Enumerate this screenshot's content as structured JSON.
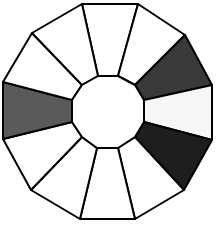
{
  "figure": {
    "outer_vertices": [
      [
        82,
        4
      ],
      [
        138,
        4
      ],
      [
        185,
        35
      ],
      [
        212,
        85
      ],
      [
        212,
        140
      ],
      [
        184,
        190
      ],
      [
        135,
        219
      ],
      [
        80,
        219
      ],
      [
        31,
        190
      ],
      [
        3,
        139
      ],
      [
        3,
        82
      ],
      [
        32,
        33
      ]
    ],
    "inner_vertices": [
      [
        98,
        76
      ],
      [
        118,
        76
      ],
      [
        135,
        85
      ],
      [
        144,
        100
      ],
      [
        144,
        122
      ],
      [
        135,
        137
      ],
      [
        118,
        148
      ],
      [
        97,
        148
      ],
      [
        82,
        137
      ],
      [
        72,
        122
      ],
      [
        72,
        100
      ],
      [
        82,
        85
      ]
    ],
    "segments": [
      {
        "name": "segment-top",
        "fill": "#ffffff"
      },
      {
        "name": "segment-upper-right-1",
        "fill": "#ffffff"
      },
      {
        "name": "segment-upper-right-2",
        "fill": "#3a3a3a"
      },
      {
        "name": "segment-right",
        "fill": "#f6f6f6"
      },
      {
        "name": "segment-lower-right-1",
        "fill": "#1e1e1e"
      },
      {
        "name": "segment-lower-right-2",
        "fill": "#ffffff"
      },
      {
        "name": "segment-bottom",
        "fill": "#ffffff"
      },
      {
        "name": "segment-lower-left-1",
        "fill": "#ffffff"
      },
      {
        "name": "segment-lower-left-2",
        "fill": "#ffffff"
      },
      {
        "name": "segment-left",
        "fill": "#5a5a5a"
      },
      {
        "name": "segment-upper-left-1",
        "fill": "#ffffff"
      },
      {
        "name": "segment-upper-left-2",
        "fill": "#ffffff"
      }
    ],
    "inner_fill": "#ffffff",
    "stroke": "#000000"
  }
}
